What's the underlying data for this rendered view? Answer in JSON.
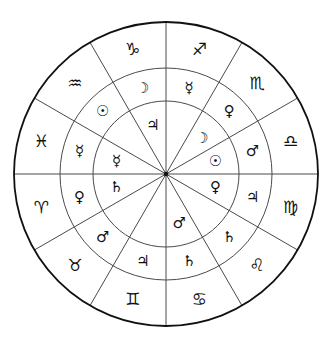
{
  "geometry": {
    "cx": 166,
    "cy": 174,
    "r_outer": 152,
    "r_middle": 106,
    "r_inner": 73,
    "sector_count": 12,
    "line_color": "#4a4a4a",
    "outer_color": "#111111"
  },
  "outer_ring": {
    "label": "zodiac signs",
    "sectors": [
      {
        "start_deg": 0,
        "symbol": "♐",
        "name": "Sagittarius"
      },
      {
        "start_deg": 30,
        "symbol": "♏",
        "name": "Scorpio"
      },
      {
        "start_deg": 60,
        "symbol": "♎",
        "name": "Libra"
      },
      {
        "start_deg": 90,
        "symbol": "♍",
        "name": "Virgo"
      },
      {
        "start_deg": 120,
        "symbol": "♌",
        "name": "Leo"
      },
      {
        "start_deg": 150,
        "symbol": "♋",
        "name": "Cancer"
      },
      {
        "start_deg": 180,
        "symbol": "♊",
        "name": "Gemini"
      },
      {
        "start_deg": 210,
        "symbol": "♉",
        "name": "Taurus"
      },
      {
        "start_deg": 240,
        "symbol": "♈",
        "name": "Aries"
      },
      {
        "start_deg": 270,
        "symbol": "♓",
        "name": "Pisces"
      },
      {
        "start_deg": 300,
        "symbol": "♒",
        "name": "Aquarius"
      },
      {
        "start_deg": 330,
        "symbol": "♑",
        "name": "Capricorn"
      }
    ]
  },
  "middle_ring": {
    "label": "planets (middle)",
    "sectors": [
      {
        "start_deg": 0,
        "symbol": "☿",
        "name": "Mercury"
      },
      {
        "start_deg": 30,
        "symbol": "♀",
        "name": "Venus"
      },
      {
        "start_deg": 60,
        "symbol": "♂",
        "name": "Mars"
      },
      {
        "start_deg": 90,
        "symbol": "♃",
        "name": "Jupiter"
      },
      {
        "start_deg": 120,
        "symbol": "♄",
        "name": "Saturn"
      },
      {
        "start_deg": 150,
        "symbol": "♄",
        "name": "Saturn"
      },
      {
        "start_deg": 180,
        "symbol": "♃",
        "name": "Jupiter"
      },
      {
        "start_deg": 210,
        "symbol": "♂",
        "name": "Mars"
      },
      {
        "start_deg": 240,
        "symbol": "♀",
        "name": "Venus"
      },
      {
        "start_deg": 270,
        "symbol": "☿",
        "name": "Mercury"
      },
      {
        "start_deg": 300,
        "symbol": "☉",
        "name": "Sun"
      },
      {
        "start_deg": 330,
        "symbol": "☽",
        "name": "Moon"
      }
    ]
  },
  "inner_ring": {
    "label": "planets (inner)",
    "sectors": [
      {
        "start_deg": 0,
        "symbol": "",
        "name": ""
      },
      {
        "start_deg": 30,
        "symbol": "☽",
        "name": "Moon"
      },
      {
        "start_deg": 60,
        "symbol": "☉",
        "name": "Sun"
      },
      {
        "start_deg": 90,
        "symbol": "♀",
        "name": "Venus"
      },
      {
        "start_deg": 120,
        "symbol": "",
        "name": ""
      },
      {
        "start_deg": 150,
        "symbol": "♂",
        "name": "Mars"
      },
      {
        "start_deg": 180,
        "symbol": "",
        "name": ""
      },
      {
        "start_deg": 210,
        "symbol": "",
        "name": ""
      },
      {
        "start_deg": 240,
        "symbol": "♄",
        "name": "Saturn"
      },
      {
        "start_deg": 270,
        "symbol": "☿",
        "name": "Mercury"
      },
      {
        "start_deg": 300,
        "symbol": "",
        "name": ""
      },
      {
        "start_deg": 330,
        "symbol": "♃",
        "name": "Jupiter"
      }
    ]
  }
}
